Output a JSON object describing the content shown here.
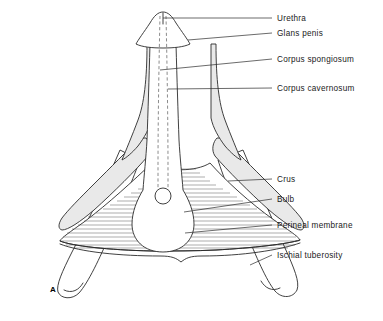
{
  "figure": {
    "marker": "A",
    "labels": [
      {
        "id": "urethra",
        "text": "Urethra",
        "x": 277,
        "y": 21
      },
      {
        "id": "glans-penis",
        "text": "Glans penis",
        "x": 277,
        "y": 36
      },
      {
        "id": "corpus-spongiosum",
        "text": "Corpus spongiosum",
        "x": 277,
        "y": 62
      },
      {
        "id": "corpus-cavernosum",
        "text": "Corpus cavernosum",
        "x": 277,
        "y": 91
      },
      {
        "id": "crus",
        "text": "Crus",
        "x": 277,
        "y": 182
      },
      {
        "id": "bulb",
        "text": "Bulb",
        "x": 277,
        "y": 202
      },
      {
        "id": "perineal-membrane",
        "text": "Perineal membrane",
        "x": 277,
        "y": 228
      },
      {
        "id": "ischial-tuberosity",
        "text": "Ischial tuberosity",
        "x": 277,
        "y": 258
      }
    ],
    "colors": {
      "ink": "#2b2b2b",
      "shading": "#e9e9e9",
      "hatch": "#4a4a4a",
      "background": "#ffffff"
    }
  }
}
